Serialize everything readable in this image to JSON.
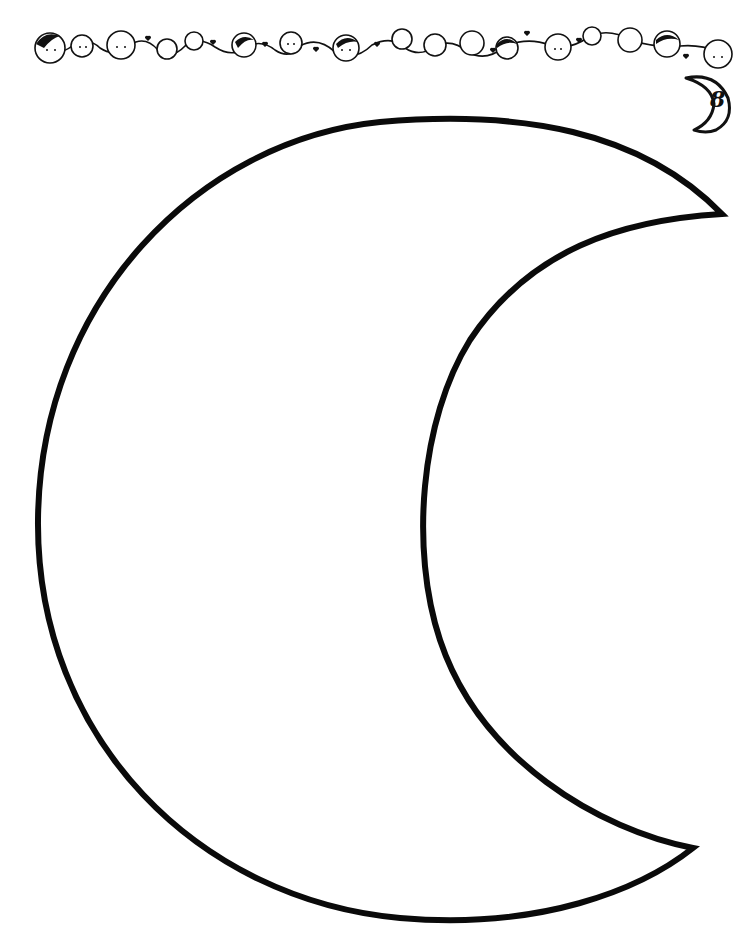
{
  "page": {
    "type": "coloring-worksheet",
    "background_color": "#ffffff",
    "ink_color": "#111111"
  },
  "border": {
    "decoration": "row of children's faces holding hands with hearts",
    "face_count": 19,
    "heart_count": 9
  },
  "badge": {
    "icon": "crescent-moon-icon",
    "number": "8"
  },
  "main_shape": {
    "name": "crescent-moon-outline",
    "upper_tip": [
      722,
      214
    ],
    "lower_tip": [
      693,
      848
    ]
  }
}
